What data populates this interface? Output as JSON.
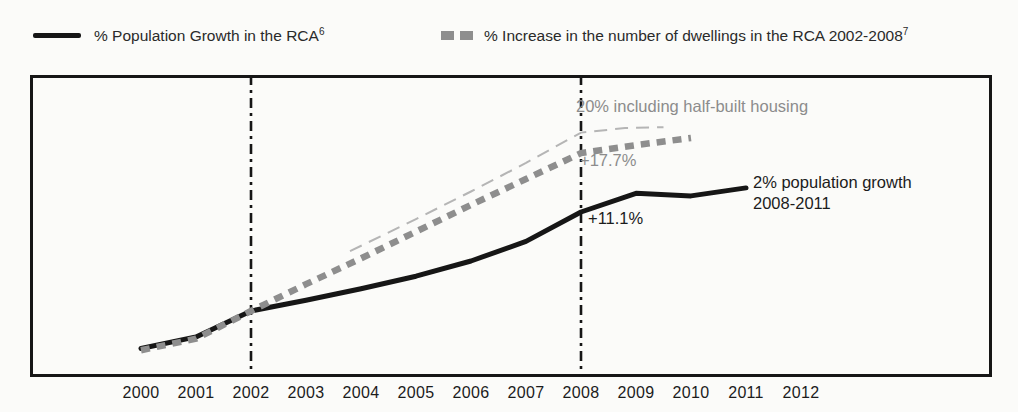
{
  "legend": {
    "items": [
      {
        "label": "% Population Growth in the RCA",
        "footnote": "6",
        "marker": "solid-line",
        "color": "#161616"
      },
      {
        "label": "% Increase in the number of dwellings in the RCA 2002-2008",
        "footnote": "7",
        "marker": "dashed-squares",
        "color": "#8e8e8e"
      }
    ]
  },
  "chart_data": {
    "type": "line",
    "title": "",
    "xlabel": "Year",
    "ylabel": "% growth indexed to 2002",
    "grid": false,
    "legend_position": "top",
    "x_ticks": [
      "2000",
      "2001",
      "2002",
      "2003",
      "2004",
      "2005",
      "2006",
      "2007",
      "2008",
      "2009",
      "2010",
      "2011",
      "2012"
    ],
    "series": [
      {
        "name": "% Population Growth in the RCA",
        "style": "solid",
        "color": "#161616",
        "points": [
          [
            2000,
            -4.2
          ],
          [
            2001,
            -2.9
          ],
          [
            2002,
            0
          ],
          [
            2003,
            1.2
          ],
          [
            2004,
            2.5
          ],
          [
            2005,
            3.9
          ],
          [
            2006,
            5.6
          ],
          [
            2007,
            7.8
          ],
          [
            2008,
            11.1
          ],
          [
            2009,
            13.2
          ],
          [
            2010,
            12.9
          ],
          [
            2011,
            13.8
          ]
        ]
      },
      {
        "name": "% Increase in the number of dwellings in the RCA 2002-2008",
        "style": "dashed-thick",
        "color": "#8e8e8e",
        "points": [
          [
            2000,
            -4.4
          ],
          [
            2001,
            -3.1
          ],
          [
            2002,
            0
          ],
          [
            2003,
            3.0
          ],
          [
            2004,
            5.9
          ],
          [
            2005,
            8.9
          ],
          [
            2006,
            11.9
          ],
          [
            2007,
            14.8
          ],
          [
            2008,
            17.7
          ],
          [
            2009,
            18.6
          ],
          [
            2010,
            19.4
          ]
        ]
      },
      {
        "name": "Dwellings increase including half-built housing",
        "style": "dashed-thin",
        "color": "#b5b5b5",
        "points": [
          [
            2003.8,
            6.7
          ],
          [
            2005,
            10.3
          ],
          [
            2006,
            13.4
          ],
          [
            2007,
            16.6
          ],
          [
            2008,
            20.0
          ],
          [
            2008.8,
            20.5
          ],
          [
            2009.5,
            20.6
          ]
        ]
      }
    ],
    "reference_lines": [
      {
        "axis": "x",
        "year": 2002,
        "style": "dash-dot",
        "color": "#161616"
      },
      {
        "axis": "x",
        "year": 2008,
        "style": "dash-dot",
        "color": "#161616"
      }
    ],
    "annotations": [
      {
        "text": "20% including half-built housing",
        "color": "#8c8c8c",
        "x": 576,
        "y": 96
      },
      {
        "text": "+17.7%",
        "color": "#8c8c8c",
        "x": 580,
        "y": 150
      },
      {
        "text": "+11.1%",
        "color": "#1c1c1c",
        "x": 588,
        "y": 208
      },
      {
        "text": "2% population growth\n2008-2011",
        "color": "#1c1c1c",
        "x": 753,
        "y": 172
      }
    ],
    "layout": {
      "x0": 141,
      "dx": 55,
      "y_baseline": 311,
      "px_per_percent": 8.92,
      "frame": {
        "left": 30,
        "top": 75,
        "width": 962,
        "height": 302
      }
    }
  }
}
